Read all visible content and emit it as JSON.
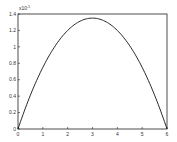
{
  "chart_data": {
    "type": "line",
    "title": "",
    "xlabel": "",
    "ylabel": "",
    "y_multiplier": "x10^?",
    "y_multiplier_note": "exponent not legible in source; -5 rendered as a placeholder guess",
    "y_multiplier_exponent_guess": -5,
    "xlim": [
      0,
      6
    ],
    "ylim": [
      0,
      1.4
    ],
    "grid": false,
    "legend": null,
    "x_ticks": [
      "0",
      "1",
      "2",
      "3",
      "4",
      "5",
      "6"
    ],
    "y_ticks": [
      "0",
      "0.2",
      "0.4",
      "0.6",
      "0.8",
      "1",
      "1.2",
      "1.4"
    ],
    "series": [
      {
        "name": "curve",
        "color": "#000000",
        "x": [
          0,
          0.5,
          1,
          1.5,
          2,
          2.5,
          3,
          3.5,
          4,
          4.5,
          5,
          5.5,
          6
        ],
        "y": [
          0,
          0.39,
          0.72,
          0.98,
          1.18,
          1.3,
          1.35,
          1.3,
          1.18,
          0.98,
          0.72,
          0.39,
          0
        ]
      }
    ]
  }
}
